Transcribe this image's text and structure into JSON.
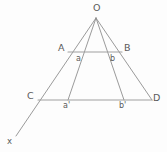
{
  "figure": {
    "type": "geometry-diagram",
    "title": "",
    "canvas": {
      "width": 167,
      "height": 152
    },
    "colors": {
      "background": "#fdfdfd",
      "stroke": "#8e8e8e",
      "stroke_light": "#a6a6a6",
      "text": "#5a5a5a"
    },
    "apex": {
      "id": "O",
      "label": "O",
      "x": 96,
      "y": 18
    },
    "labels": {
      "apex": "O",
      "upper_left": "A",
      "upper_right": "B",
      "lower_left": "C",
      "lower_right": "D",
      "inner_upper_left": "a",
      "inner_upper_right": "b",
      "inner_lower_left": "a'",
      "inner_lower_right": "b'",
      "axis": "x"
    },
    "points": [
      {
        "name": "O",
        "label": "O",
        "x": 96,
        "y": 18,
        "label_x": 93,
        "label_y": 3
      },
      {
        "name": "A",
        "label": "A",
        "x": 68,
        "y": 52,
        "label_x": 58,
        "label_y": 43
      },
      {
        "name": "B",
        "label": "B",
        "x": 122,
        "y": 52,
        "label_x": 124,
        "label_y": 43
      },
      {
        "name": "C",
        "label": "C",
        "x": 38,
        "y": 100,
        "label_x": 27,
        "label_y": 91
      },
      {
        "name": "D",
        "label": "D",
        "x": 152,
        "y": 100,
        "label_x": 153,
        "label_y": 93
      },
      {
        "name": "a",
        "label": "a",
        "x": 80,
        "y": 52,
        "label_x": 76,
        "label_y": 55
      },
      {
        "name": "b",
        "label": "b",
        "x": 110,
        "y": 52,
        "label_x": 110,
        "label_y": 55
      },
      {
        "name": "a'",
        "label": "a'",
        "x": 68,
        "y": 100,
        "label_x": 63,
        "label_y": 102
      },
      {
        "name": "b'",
        "label": "b'",
        "x": 124,
        "y": 100,
        "label_x": 119,
        "label_y": 102
      },
      {
        "name": "x",
        "label": "x",
        "x": 16,
        "y": 136,
        "label_x": 7,
        "label_y": 137
      }
    ],
    "rays": [
      {
        "name": "ray-O-A-C-x",
        "from": "O",
        "through": [
          "A",
          "C"
        ],
        "to": "x",
        "x1": 96,
        "y1": 18,
        "x2": 16,
        "y2": 136
      },
      {
        "name": "ray-O-a-aprime",
        "from": "O",
        "through": [
          "a"
        ],
        "to": "a'",
        "x1": 96,
        "y1": 18,
        "x2": 68,
        "y2": 100
      },
      {
        "name": "ray-O-b-bprime",
        "from": "O",
        "through": [
          "b"
        ],
        "to": "b'",
        "x1": 96,
        "y1": 18,
        "x2": 124,
        "y2": 100
      },
      {
        "name": "ray-O-B-D",
        "from": "O",
        "through": [
          "B"
        ],
        "to": "D",
        "x1": 96,
        "y1": 18,
        "x2": 152,
        "y2": 100
      }
    ],
    "segments": [
      {
        "name": "segment-AB",
        "from": "A",
        "to": "B",
        "x1": 68,
        "y1": 52,
        "x2": 122,
        "y2": 52
      },
      {
        "name": "segment-CD",
        "from": "C",
        "to": "D",
        "x1": 38,
        "y1": 100,
        "x2": 152,
        "y2": 100
      }
    ]
  }
}
